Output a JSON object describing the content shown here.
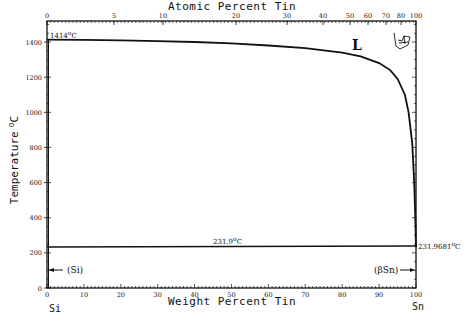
{
  "chart_data": {
    "type": "line",
    "title": "",
    "top_axis_label": "Atomic Percent Tin",
    "xlabel": "Weight Percent Tin",
    "ylabel": "Temperature °C",
    "xlim": [
      0,
      100
    ],
    "ylim": [
      0,
      1500
    ],
    "grid": false,
    "x_ticks": [
      0,
      10,
      20,
      30,
      40,
      50,
      60,
      70,
      80,
      90,
      100
    ],
    "top_ticks": [
      0,
      5,
      10,
      20,
      30,
      40,
      50,
      60,
      70,
      80,
      100
    ],
    "y_ticks": [
      0,
      200,
      400,
      600,
      800,
      1000,
      1200,
      1400
    ],
    "left_element": "Si",
    "right_element": "Sn",
    "series": [
      {
        "name": "Liquidus",
        "x": [
          0,
          10,
          20,
          30,
          40,
          50,
          60,
          70,
          80,
          85,
          90,
          93,
          95,
          97,
          98,
          99,
          99.5,
          99.8,
          100
        ],
        "y": [
          1414,
          1412,
          1410,
          1405,
          1400,
          1392,
          1380,
          1365,
          1340,
          1318,
          1280,
          1240,
          1190,
          1100,
          1000,
          820,
          600,
          400,
          232
        ]
      },
      {
        "name": "Eutectic / Sn melting isotherm",
        "x": [
          0,
          100
        ],
        "y": [
          231.9,
          231.9681
        ]
      }
    ],
    "annotations": [
      {
        "text": "1414°C",
        "x": 0,
        "y": 1414
      },
      {
        "text": "L",
        "x": 77,
        "y": 1300
      },
      {
        "text": "231.9°C",
        "x": 50,
        "y": 232
      },
      {
        "text": "231.9681°C",
        "x": 100,
        "y": 232
      },
      {
        "text": "(Si)",
        "x": 3,
        "y": 110
      },
      {
        "text": "(βSn)",
        "x": 93,
        "y": 110
      }
    ]
  },
  "labels": {
    "top_axis": "Atomic Percent Tin",
    "bottom_axis": "Weight Percent Tin",
    "y_axis": "Temperature",
    "y_axis_unit": "°C",
    "si": "Si",
    "sn": "Sn",
    "si_melt": "1414°C",
    "liquid": "L",
    "eutectic": "231.9°C",
    "sn_melt": "231.9681°C",
    "si_phase": "(Si)",
    "sn_phase": "(βSn)"
  }
}
